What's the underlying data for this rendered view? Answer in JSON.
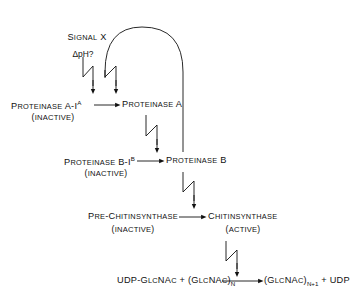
{
  "diagram": {
    "type": "flow-diagram",
    "background_color": "#ffffff",
    "line_color": "#111111",
    "nodes": {
      "signal": {
        "label": "Signal X"
      },
      "ph": {
        "label": "ΔpH?"
      },
      "proteinase_a_i": {
        "label_main": "Proteinase A-I",
        "label_sup": "A",
        "state": "(inactive)"
      },
      "proteinase_a": {
        "label": "Proteinase A"
      },
      "proteinase_b_i": {
        "label_main": "Proteinase B-I",
        "label_sup": "B",
        "state": "(inactive)"
      },
      "proteinase_b": {
        "label": "Proteinase B"
      },
      "pre_chitinsynthase": {
        "label": "Pre-Chitinsynthase",
        "state": "(inactive)"
      },
      "chitinsynthase": {
        "label": "Chitinsynthase",
        "state": "(active)"
      },
      "reaction_left": {
        "part1": "UDP-GlcNAc",
        "plus": "+",
        "part2_main": "(GlcNAc)",
        "part2_sub": "N"
      },
      "reaction_right": {
        "part1_main": "(GlcNAc)",
        "part1_sub": "N+1",
        "plus": "+",
        "part2": "UDP"
      }
    },
    "edges": [
      {
        "name": "signal-x-to-proteinase-a-i",
        "style": "lightning-arrow"
      },
      {
        "name": "feedback-to-proteinase-a",
        "style": "lightning-arrow"
      },
      {
        "name": "proteinase-a-i-to-proteinase-a",
        "style": "straight-arrow"
      },
      {
        "name": "proteinase-a-to-proteinase-b",
        "style": "lightning-arrow"
      },
      {
        "name": "proteinase-b-i-to-proteinase-b",
        "style": "straight-arrow"
      },
      {
        "name": "proteinase-b-to-chitinsynthase",
        "style": "lightning-arrow"
      },
      {
        "name": "pre-chitinsynthase-to-chitinsynthase",
        "style": "straight-arrow"
      },
      {
        "name": "chitinsynthase-to-reaction",
        "style": "lightning-arrow"
      },
      {
        "name": "reaction-arrow",
        "style": "straight-arrow"
      },
      {
        "name": "proteinase-b-feedback-arch",
        "style": "curved-arch"
      }
    ]
  }
}
